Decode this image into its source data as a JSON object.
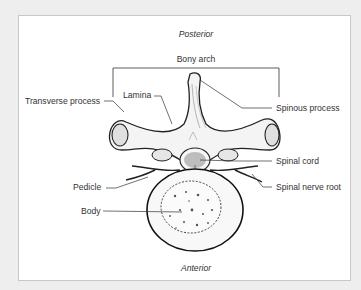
{
  "diagram": {
    "orientation": {
      "top": "Posterior",
      "bottom": "Anterior"
    },
    "bracket_label": "Bony arch",
    "labels": {
      "transverse_process": "Transverse process",
      "lamina": "Lamina",
      "spinous_process": "Spinous process",
      "spinal_cord": "Spinal cord",
      "pedicle": "Pedicle",
      "spinal_nerve_root": "Spinal nerve root",
      "body": "Body"
    },
    "colors": {
      "background": "#eeeeee",
      "panel": "#ffffff",
      "line": "#333333",
      "cord_fill": "#bdbdbd",
      "bone_shade": "#e2e2e2"
    }
  }
}
